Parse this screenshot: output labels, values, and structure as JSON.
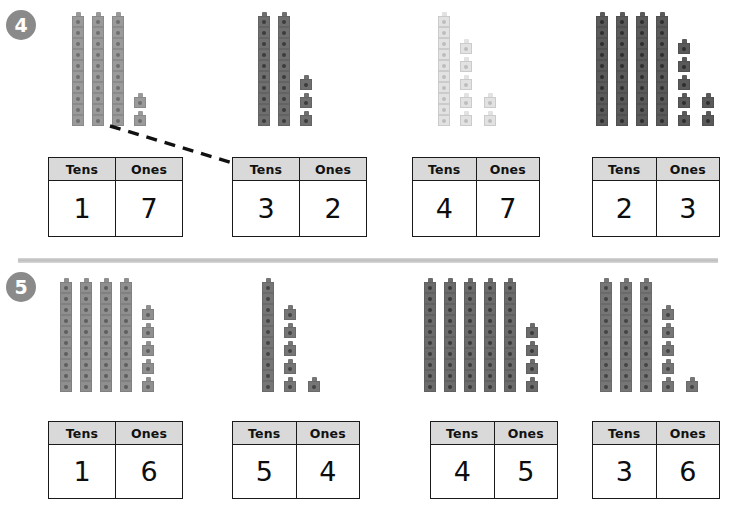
{
  "worksheet": {
    "title": "Tens and Ones place value matching worksheet",
    "table_headers": {
      "tens": "Tens",
      "ones": "Ones"
    },
    "colors": {
      "badge_bg": "#8a8a8a",
      "badge_text": "#ffffff",
      "header_fill": "#d9d9d9",
      "border": "#1a1a1a",
      "divider": "#cccccc",
      "connector": "#111111"
    }
  },
  "problems": [
    {
      "number": "4",
      "badge_label": "4",
      "cube_groups": [
        {
          "id": "p4-g1",
          "towers": 3,
          "ones": 2,
          "cube_color": "#9a9a9a",
          "dot_color": "#6e6e6e",
          "ones_layout": "single-column"
        },
        {
          "id": "p4-g2",
          "towers": 2,
          "ones": 3,
          "cube_color": "#6f6f6f",
          "dot_color": "#3c3c3c",
          "ones_layout": "single-column"
        },
        {
          "id": "p4-g3",
          "towers": 1,
          "ones": 7,
          "cube_color": "#e2e2e2",
          "dot_color": "#bdbdbd",
          "ones_layout": "two-column"
        },
        {
          "id": "p4-g4",
          "towers": 4,
          "ones": 7,
          "cube_color": "#5a5a5a",
          "dot_color": "#2e2e2e",
          "ones_layout": "two-column"
        }
      ],
      "tables": [
        {
          "id": "p4-t1",
          "tens": "1",
          "ones": "7"
        },
        {
          "id": "p4-t2",
          "tens": "3",
          "ones": "2"
        },
        {
          "id": "p4-t3",
          "tens": "4",
          "ones": "7"
        },
        {
          "id": "p4-t4",
          "tens": "2",
          "ones": "3"
        }
      ],
      "connector": {
        "from": "p4-g1",
        "to": "p4-t2",
        "style": "dashed",
        "x1": 110,
        "y1": 126,
        "x2": 236,
        "y2": 164
      }
    },
    {
      "number": "5",
      "badge_label": "5",
      "cube_groups": [
        {
          "id": "p5-g1",
          "towers": 4,
          "ones": 5,
          "cube_color": "#8f8f8f",
          "dot_color": "#5e5e5e",
          "ones_layout": "single-column"
        },
        {
          "id": "p5-g2",
          "towers": 1,
          "ones": 6,
          "cube_color": "#767676",
          "dot_color": "#444444",
          "ones_layout": "two-column"
        },
        {
          "id": "p5-g3",
          "towers": 5,
          "ones": 4,
          "cube_color": "#6b6b6b",
          "dot_color": "#3a3a3a",
          "ones_layout": "single-column"
        },
        {
          "id": "p5-g4",
          "towers": 3,
          "ones": 6,
          "cube_color": "#767676",
          "dot_color": "#444444",
          "ones_layout": "two-column"
        }
      ],
      "tables": [
        {
          "id": "p5-t1",
          "tens": "1",
          "ones": "6"
        },
        {
          "id": "p5-t2",
          "tens": "5",
          "ones": "4"
        },
        {
          "id": "p5-t3",
          "tens": "4",
          "ones": "5"
        },
        {
          "id": "p5-t4",
          "tens": "3",
          "ones": "6"
        }
      ],
      "connector": null
    }
  ],
  "layout": {
    "badges": [
      {
        "x": 6,
        "y": 10
      },
      {
        "x": 6,
        "y": 272
      }
    ],
    "divider": {
      "x": 18,
      "y": 258,
      "width": 700
    },
    "group_origins": [
      [
        {
          "x": 72,
          "y": 12
        },
        {
          "x": 258,
          "y": 12
        },
        {
          "x": 438,
          "y": 12
        },
        {
          "x": 596,
          "y": 12
        }
      ],
      [
        {
          "x": 60,
          "y": 278
        },
        {
          "x": 262,
          "y": 278
        },
        {
          "x": 424,
          "y": 278
        },
        {
          "x": 600,
          "y": 278
        }
      ]
    ],
    "table_rects": [
      [
        {
          "x": 48,
          "y": 157,
          "w": 135,
          "h": 80
        },
        {
          "x": 232,
          "y": 157,
          "w": 135,
          "h": 80
        },
        {
          "x": 412,
          "y": 157,
          "w": 128,
          "h": 80
        },
        {
          "x": 592,
          "y": 157,
          "w": 128,
          "h": 80
        }
      ],
      [
        {
          "x": 48,
          "y": 421,
          "w": 135,
          "h": 78
        },
        {
          "x": 232,
          "y": 421,
          "w": 128,
          "h": 78
        },
        {
          "x": 430,
          "y": 421,
          "w": 128,
          "h": 78
        },
        {
          "x": 592,
          "y": 421,
          "w": 128,
          "h": 78
        }
      ]
    ]
  }
}
